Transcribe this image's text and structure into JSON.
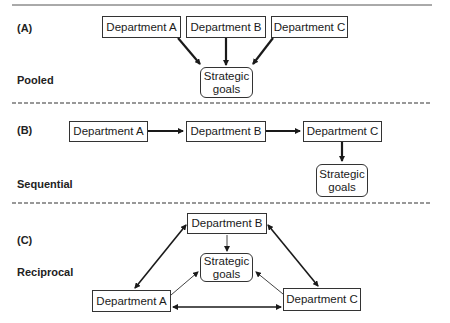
{
  "sections": [
    {
      "id": "A",
      "letter": "(A)",
      "name": "Pooled",
      "boxes": [
        "Department A",
        "Department B",
        "Department C"
      ],
      "goal": "Strategic goals"
    },
    {
      "id": "B",
      "letter": "(B)",
      "name": "Sequential",
      "boxes": [
        "Department A",
        "Department B",
        "Department C"
      ],
      "goal": "Strategic goals"
    },
    {
      "id": "C",
      "letter": "(C)",
      "name": "Reciprocal",
      "boxes": [
        "Department A",
        "Department B",
        "Department C"
      ],
      "goal": "Strategic goals"
    }
  ]
}
